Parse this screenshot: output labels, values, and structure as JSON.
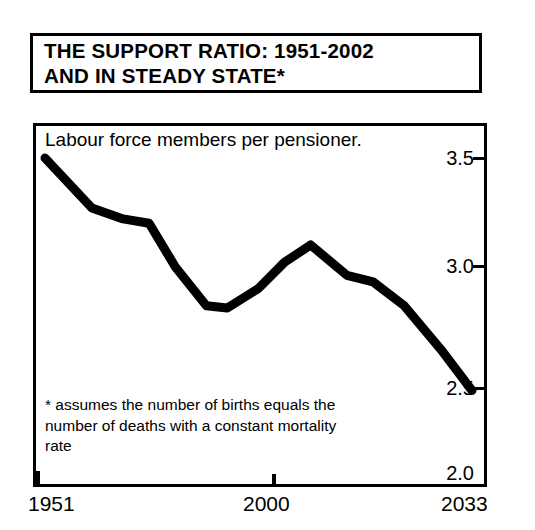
{
  "title": {
    "line1": "THE SUPPORT RATIO: 1951-2002",
    "line2": "AND IN STEADY STATE*"
  },
  "subtitle": "Labour force members per pensioner.",
  "footnote": {
    "line1": "*  assumes the number of births equals the",
    "line2": "number of deaths with a constant mortality",
    "line3": "rate"
  },
  "axis": {
    "y_ticks": [
      "3.5",
      "3.0",
      "2.5",
      "2.0"
    ],
    "x_ticks": [
      "1951",
      "2000",
      "2033"
    ]
  },
  "chart_data": {
    "type": "line",
    "title": "THE SUPPORT RATIO: 1951-2002 AND IN STEADY STATE*",
    "subtitle": "Labour force members per pensioner.",
    "xlabel": "",
    "ylabel": "Labour force members per pensioner",
    "xlim": [
      1951,
      2033
    ],
    "ylim": [
      2.0,
      3.5
    ],
    "yticks": [
      2.0,
      2.5,
      3.0,
      3.5
    ],
    "xticks": [
      1951,
      2000,
      2033
    ],
    "grid": false,
    "legend": "none",
    "line_color": "#000000",
    "line_width": 9,
    "annotation": "* assumes the number of births equals the number of deaths with a constant mortality rate",
    "series": [
      {
        "name": "Support ratio",
        "x": [
          1951,
          1960,
          1966,
          1971,
          1976,
          1982,
          1986,
          1992,
          1997,
          2002,
          2009,
          2014,
          2020,
          2027,
          2033
        ],
        "y": [
          3.5,
          3.27,
          3.22,
          3.2,
          3.0,
          2.82,
          2.81,
          2.9,
          3.02,
          3.1,
          2.96,
          2.93,
          2.82,
          2.62,
          2.43
        ]
      }
    ]
  }
}
